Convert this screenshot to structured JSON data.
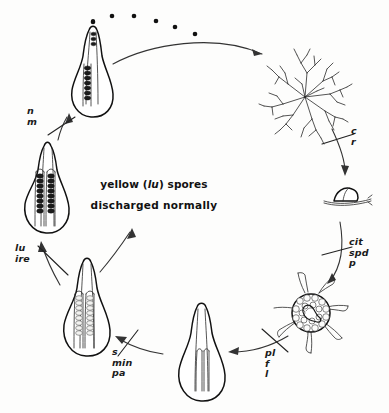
{
  "diagram": {
    "center_note": {
      "line1_prefix": "yellow (",
      "line1_gene": "lu",
      "line1_suffix": ") spores",
      "line2": "discharged  normally"
    },
    "blocked_steps": [
      {
        "id": "n-m",
        "position": "upper-left",
        "lines": [
          "n",
          "m"
        ]
      },
      {
        "id": "lu-ire",
        "position": "left",
        "lines": [
          "lu",
          "ire"
        ]
      },
      {
        "id": "s-min-pa",
        "position": "lower-left",
        "lines": [
          "s",
          "min",
          "pa"
        ]
      },
      {
        "id": "pl-f-l",
        "position": "lower-right",
        "lines": [
          "pl",
          "f",
          "l"
        ]
      },
      {
        "id": "c-r",
        "position": "upper-right",
        "lines": [
          "c",
          "r"
        ]
      },
      {
        "id": "cit-spd-p",
        "position": "right",
        "lines": [
          "cit",
          "spd",
          "p"
        ]
      }
    ],
    "stages": [
      {
        "id": "discharging-perithecium",
        "name": "perithecium discharging spores",
        "position": "top-left"
      },
      {
        "id": "spore-trail",
        "name": "ejected ascospores",
        "dot_count": 6,
        "position": "top"
      },
      {
        "id": "mycelium",
        "name": "branching mycelial colony",
        "position": "top-right"
      },
      {
        "id": "germinating-spore",
        "name": "germinating spore on hypha",
        "position": "right"
      },
      {
        "id": "protoperithecium",
        "name": "protoperithecium with trichogyne",
        "position": "bottom-right"
      },
      {
        "id": "young-perithecium",
        "name": "young perithecium with asci",
        "position": "bottom"
      },
      {
        "id": "immature-ascospores",
        "name": "perithecium with immature pale ascospores",
        "position": "bottom-left"
      },
      {
        "id": "mature-ascospores",
        "name": "perithecium with mature dark ascospores",
        "position": "left"
      }
    ],
    "colors": {
      "ink": "#111111",
      "background": "#fdfdfc",
      "pale_spore": "#f2f2f0"
    }
  }
}
